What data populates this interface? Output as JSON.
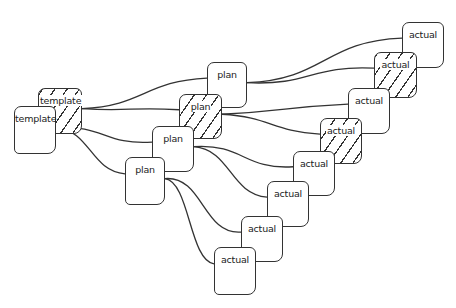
{
  "diagram": {
    "title": "",
    "style": "hand-drawn sketch",
    "colors": {
      "stroke": "#333333",
      "background": "#ffffff"
    },
    "nodes": [
      {
        "id": "t1",
        "label": "template",
        "type": "template",
        "hatched": true,
        "x": 38,
        "y": 88,
        "w": 44,
        "h": 46
      },
      {
        "id": "t2",
        "label": "template",
        "type": "template",
        "hatched": false,
        "x": 14,
        "y": 106,
        "w": 42,
        "h": 48
      },
      {
        "id": "p1",
        "label": "plan",
        "type": "plan",
        "hatched": false,
        "x": 207,
        "y": 62,
        "w": 40,
        "h": 46
      },
      {
        "id": "p2",
        "label": "plan",
        "type": "plan",
        "hatched": true,
        "x": 179,
        "y": 94,
        "w": 43,
        "h": 45
      },
      {
        "id": "p3",
        "label": "plan",
        "type": "plan",
        "hatched": false,
        "x": 152,
        "y": 126,
        "w": 42,
        "h": 46
      },
      {
        "id": "p4",
        "label": "plan",
        "type": "plan",
        "hatched": false,
        "x": 125,
        "y": 157,
        "w": 40,
        "h": 48
      },
      {
        "id": "a1",
        "label": "actual",
        "type": "actual",
        "hatched": false,
        "x": 402,
        "y": 22,
        "w": 42,
        "h": 46
      },
      {
        "id": "a2",
        "label": "actual",
        "type": "actual",
        "hatched": true,
        "x": 374,
        "y": 52,
        "w": 43,
        "h": 46
      },
      {
        "id": "a3",
        "label": "actual",
        "type": "actual",
        "hatched": false,
        "x": 348,
        "y": 88,
        "w": 42,
        "h": 46
      },
      {
        "id": "a4",
        "label": "actual",
        "type": "actual",
        "hatched": true,
        "x": 320,
        "y": 118,
        "w": 42,
        "h": 46
      },
      {
        "id": "a5",
        "label": "actual",
        "type": "actual",
        "hatched": false,
        "x": 293,
        "y": 151,
        "w": 42,
        "h": 45
      },
      {
        "id": "a6",
        "label": "actual",
        "type": "actual",
        "hatched": false,
        "x": 267,
        "y": 181,
        "w": 42,
        "h": 46
      },
      {
        "id": "a7",
        "label": "actual",
        "type": "actual",
        "hatched": false,
        "x": 241,
        "y": 216,
        "w": 42,
        "h": 46
      },
      {
        "id": "a8",
        "label": "actual",
        "type": "actual",
        "hatched": false,
        "x": 214,
        "y": 247,
        "w": 42,
        "h": 48
      }
    ],
    "edges": [
      {
        "from": "t1",
        "to": "p1"
      },
      {
        "from": "t1",
        "to": "p2"
      },
      {
        "from": "t2",
        "to": "p3"
      },
      {
        "from": "t2",
        "to": "p4"
      },
      {
        "from": "p1",
        "to": "a1"
      },
      {
        "from": "p1",
        "to": "a2"
      },
      {
        "from": "p2",
        "to": "a3"
      },
      {
        "from": "p2",
        "to": "a4"
      },
      {
        "from": "p3",
        "to": "a5"
      },
      {
        "from": "p3",
        "to": "a6"
      },
      {
        "from": "p4",
        "to": "a7"
      },
      {
        "from": "p4",
        "to": "a8"
      }
    ]
  }
}
